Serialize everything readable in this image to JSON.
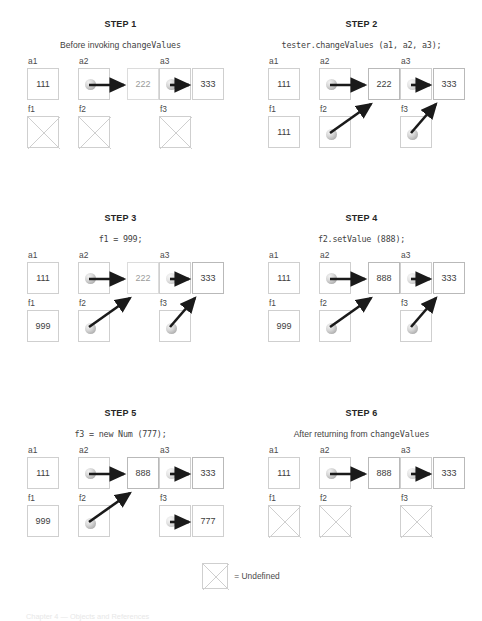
{
  "legend": {
    "symbol_name": "undefined-box",
    "text": "= Undefined"
  },
  "footer": {
    "text": "Chapter 4  —  Objects and References"
  },
  "colors": {
    "box_border": "#cfcfcf",
    "box_border_strong": "#b9b9b9",
    "arrow": "#1a1a1a",
    "text": "#3d3d3d",
    "title": "#262626",
    "ball_gray": "#b4b4b4"
  },
  "labels": {
    "a1": "a1",
    "a2": "a2",
    "a3": "a3",
    "f1": "f1",
    "f2": "f2",
    "f3": "f3"
  },
  "steps": [
    {
      "id": "step-1",
      "title": "STEP 1",
      "caption_plain": "Before invoking ",
      "caption_mono": "changeValues",
      "caption_style": "mixed",
      "a1": "111",
      "a2_value": "222",
      "a3_value": "333",
      "f1": "",
      "f1_undefined": true,
      "f2_undefined": true,
      "f3_undefined": true,
      "a2_faded": true,
      "a3_faded": false
    },
    {
      "id": "step-2",
      "title": "STEP 2",
      "caption_plain": "tester.changeValues (a1, a2, a3);",
      "caption_mono": "",
      "caption_style": "mono",
      "a1": "111",
      "a2_value": "222",
      "a3_value": "333",
      "f1": "111",
      "f1_undefined": false,
      "f2_undefined": false,
      "f3_undefined": false,
      "a2_faded": false,
      "a3_faded": false
    },
    {
      "id": "step-3",
      "title": "STEP 3",
      "caption_plain": "f1 = 999;",
      "caption_mono": "",
      "caption_style": "mono",
      "a1": "111",
      "a2_value": "222",
      "a3_value": "333",
      "f1": "999",
      "f1_undefined": false,
      "f2_undefined": false,
      "f3_undefined": false,
      "a2_faded": true,
      "a3_faded": false
    },
    {
      "id": "step-4",
      "title": "STEP 4",
      "caption_plain": "f2.setValue (888);",
      "caption_mono": "",
      "caption_style": "mono",
      "a1": "111",
      "a2_value": "888",
      "a3_value": "333",
      "f1": "999",
      "f1_undefined": false,
      "f2_undefined": false,
      "f3_undefined": false,
      "a2_faded": false,
      "a3_faded": false
    },
    {
      "id": "step-5",
      "title": "STEP 5",
      "caption_plain": "f3 = new Num (777);",
      "caption_mono": "",
      "caption_style": "mono",
      "a1": "111",
      "a2_value": "888",
      "a3_value": "333",
      "f1": "999",
      "f3_new_value": "777",
      "f1_undefined": false,
      "f2_undefined": false,
      "f3_undefined": false,
      "a2_faded": false,
      "a3_faded": false
    },
    {
      "id": "step-6",
      "title": "STEP 6",
      "caption_plain": "After returning from ",
      "caption_mono": "changeValues",
      "caption_style": "mixed",
      "a1": "111",
      "a2_value": "888",
      "a3_value": "333",
      "f1": "",
      "f1_undefined": true,
      "f2_undefined": true,
      "f3_undefined": true,
      "a2_faded": false,
      "a3_faded": false
    }
  ]
}
